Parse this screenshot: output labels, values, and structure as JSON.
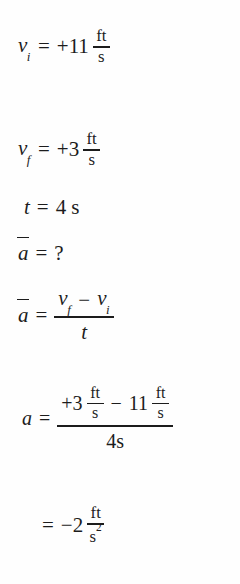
{
  "document": {
    "kind": "physics-worked-example",
    "topic": "average-acceleration",
    "background_color": "#fefefe",
    "text_color": "#1c1c1c"
  },
  "equations": [
    {
      "id": "given-initial-velocity",
      "lhs": "v",
      "lhs_sub": "i",
      "relation": "=",
      "sign": "+",
      "value": "11",
      "unit_numerator": "ft",
      "unit_denominator": "s"
    },
    {
      "id": "given-final-velocity",
      "lhs": "v",
      "lhs_sub": "f",
      "relation": "=",
      "sign": "+",
      "value": "3",
      "unit_numerator": "ft",
      "unit_denominator": "s"
    },
    {
      "id": "given-time",
      "lhs": "t",
      "relation": "=",
      "value": "4",
      "unit": "s"
    },
    {
      "id": "unknown-average-acceleration",
      "lhs": "a",
      "relation": "=",
      "value": "?"
    },
    {
      "id": "definition-average-acceleration",
      "lhs": "a",
      "relation": "=",
      "numerator_first": "v",
      "numerator_first_sub": "f",
      "numerator_operator": "−",
      "numerator_second": "v",
      "numerator_second_sub": "i",
      "denominator": "t"
    },
    {
      "id": "substitution",
      "lhs": "a",
      "relation": "=",
      "num_term1_sign": "+",
      "num_term1_value": "3",
      "num_term1_unit_numerator": "ft",
      "num_term1_unit_denominator": "s",
      "num_operator": "−",
      "num_term2_value": "11",
      "num_term2_unit_numerator": "ft",
      "num_term2_unit_denominator": "s",
      "denominator": "4s"
    },
    {
      "id": "result",
      "relation": "=",
      "sign": "−",
      "value": "2",
      "unit_numerator": "ft",
      "unit_denominator": "s",
      "unit_denominator_exponent": "2"
    }
  ]
}
